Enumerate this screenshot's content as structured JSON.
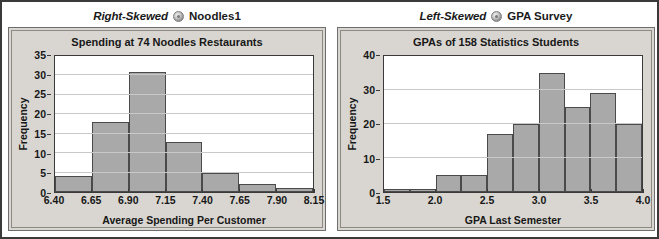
{
  "figure": {
    "panels": [
      {
        "header": {
          "skew_label": "Right-Skewed",
          "icon": "disc-icon",
          "dataset_label": "Noodles1"
        },
        "chart_data": {
          "type": "bar",
          "title": "Spending at 74 Noodles Restaurants",
          "xlabel": "Average Spending Per Customer",
          "ylabel": "Frequency",
          "categories": [
            "6.40-6.65",
            "6.65-6.90",
            "6.90-7.15",
            "7.15-7.40",
            "7.40-7.65",
            "7.65-7.90",
            "7.90-8.15"
          ],
          "values": [
            4,
            18,
            31,
            13,
            5,
            2,
            1
          ],
          "xticks": [
            "6.40",
            "6.65",
            "6.90",
            "7.15",
            "7.40",
            "7.65",
            "7.90",
            "8.15"
          ],
          "yticks": [
            "0",
            "5",
            "10",
            "15",
            "20",
            "25",
            "30",
            "35"
          ],
          "xlim": [
            6.4,
            8.15
          ],
          "ylim": [
            0,
            35
          ],
          "grid": true,
          "legend": "none",
          "bar_color": "#a9a9a9",
          "bar_edge_color": "#4a4a4a"
        }
      },
      {
        "header": {
          "skew_label": "Left-Skewed",
          "icon": "disc-icon",
          "dataset_label": "GPA Survey"
        },
        "chart_data": {
          "type": "bar",
          "title": "GPAs of 158 Statistics Students",
          "xlabel": "GPA Last Semester",
          "ylabel": "Frequency",
          "categories": [
            "1.5-1.75",
            "1.75-2.0",
            "2.0-2.25",
            "2.25-2.5",
            "2.5-2.75",
            "2.75-3.0",
            "3.0-3.25",
            "3.25-3.5",
            "3.5-3.75",
            "3.75-4.0"
          ],
          "values": [
            1,
            1,
            5,
            5,
            17,
            20,
            35,
            25,
            29,
            20
          ],
          "xticks": [
            "1.5",
            "2.0",
            "2.5",
            "3.0",
            "3.5",
            "4.0"
          ],
          "yticks": [
            "0",
            "10",
            "20",
            "30",
            "40"
          ],
          "xlim": [
            1.5,
            4.0
          ],
          "ylim": [
            0,
            40
          ],
          "grid": true,
          "legend": "none",
          "bar_color": "#a9a9a9",
          "bar_edge_color": "#4a4a4a"
        }
      }
    ]
  }
}
